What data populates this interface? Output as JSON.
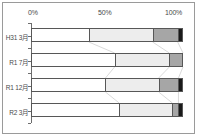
{
  "chart_data": {
    "type": "bar",
    "orientation": "horizontal",
    "stacked": true,
    "normalized_percent": true,
    "title": "",
    "xlabel": "",
    "ylabel": "",
    "xlim": [
      0,
      100
    ],
    "grid": false,
    "legend": "none",
    "x_tick_labels": [
      "0%",
      "50%",
      "100%"
    ],
    "x_tick_values": [
      0,
      50,
      100
    ],
    "categories": [
      "H31 3月",
      "R1  7月",
      "R1 12月",
      "R2  3月"
    ],
    "series": [
      {
        "name": "segment-1",
        "color": "#ffffff",
        "values": [
          38,
          55,
          49,
          58
        ]
      },
      {
        "name": "segment-2",
        "color": "#ededed",
        "values": [
          42,
          36,
          35,
          35
        ]
      },
      {
        "name": "segment-3",
        "color": "#a6a6a6",
        "values": [
          16.5,
          9,
          13,
          4
        ]
      },
      {
        "name": "segment-4",
        "color": "#1a1a1a",
        "values": [
          3.5,
          0,
          3,
          3
        ]
      }
    ],
    "connector_color": "#cfcfcf",
    "border_color": "#575757",
    "frame_color": "#9a9a9a",
    "axis_color": "#6d6d6d",
    "text_color": "#4a4a4a"
  }
}
